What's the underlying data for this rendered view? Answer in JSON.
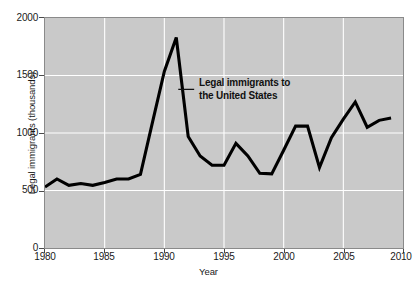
{
  "chart_data": {
    "type": "line",
    "title": "",
    "xlabel": "Year",
    "ylabel": "Legal immigrants (thousands)",
    "xlim": [
      1980,
      2010
    ],
    "ylim": [
      0,
      2000
    ],
    "xticks": [
      1980,
      1985,
      1990,
      1995,
      2000,
      2005,
      2010
    ],
    "yticks": [
      0,
      500,
      1000,
      1500,
      2000
    ],
    "grid": true,
    "legend": "none",
    "series_color": "#000000",
    "plot_background": "#c9c9c9",
    "gridline_color": "#ffffff",
    "annotations": [
      {
        "text_line1": "Legal immigrants to",
        "text_line2": "the United States",
        "points_to_year": 1991,
        "points_to_value": 1830
      }
    ],
    "x": [
      1980,
      1981,
      1982,
      1983,
      1984,
      1985,
      1986,
      1987,
      1988,
      1989,
      1990,
      1991,
      1992,
      1993,
      1994,
      1995,
      1996,
      1997,
      1998,
      1999,
      2000,
      2001,
      2002,
      2003,
      2004,
      2005,
      2006,
      2007,
      2008,
      2009
    ],
    "series": [
      {
        "name": "Legal immigrants to the United States",
        "values": [
          530,
          600,
          545,
          560,
          545,
          570,
          600,
          600,
          640,
          1090,
          1535,
          1830,
          970,
          800,
          720,
          720,
          910,
          800,
          650,
          645,
          850,
          1060,
          1060,
          700,
          960,
          1120,
          1270,
          1050,
          1110,
          1130
        ]
      }
    ]
  },
  "axes": {
    "y_tick_labels": [
      "2000",
      "1500",
      "1000",
      "500",
      "0"
    ],
    "x_tick_labels": [
      "1980",
      "1985",
      "1990",
      "1995",
      "2000",
      "2005",
      "2010"
    ],
    "y_axis_title": "Legal immigrants (thousands)",
    "x_axis_title": "Year"
  },
  "annotation": {
    "line1": "Legal immigrants to",
    "line2": "the United States"
  }
}
